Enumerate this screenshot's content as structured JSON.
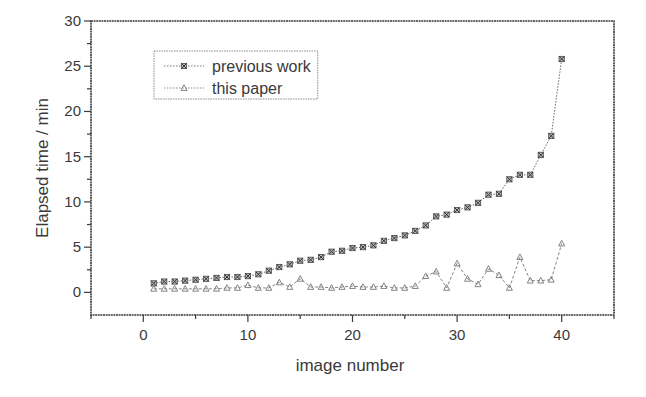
{
  "chart_data": {
    "type": "line",
    "title": "",
    "xlabel": "image number",
    "ylabel": "Elapsed time / min",
    "xlim": [
      -5,
      45
    ],
    "ylim": [
      -2.5,
      30
    ],
    "xticks": [
      0,
      10,
      20,
      30,
      40
    ],
    "yticks": [
      0,
      5,
      10,
      15,
      20,
      25,
      30
    ],
    "grid": false,
    "legend_position": "upper-left (inset box)",
    "x": [
      1,
      2,
      3,
      4,
      5,
      6,
      7,
      8,
      9,
      10,
      11,
      12,
      13,
      14,
      15,
      16,
      17,
      18,
      19,
      20,
      21,
      22,
      23,
      24,
      25,
      26,
      27,
      28,
      29,
      30,
      31,
      32,
      33,
      34,
      35,
      36,
      37,
      38,
      39,
      40
    ],
    "series": [
      {
        "name": "previous work",
        "marker": "x-square",
        "line": "dotted",
        "values": [
          1.0,
          1.2,
          1.2,
          1.3,
          1.4,
          1.5,
          1.6,
          1.7,
          1.7,
          1.8,
          2.0,
          2.4,
          2.8,
          3.1,
          3.5,
          3.6,
          3.9,
          4.5,
          4.6,
          4.9,
          5.0,
          5.2,
          5.7,
          6.0,
          6.3,
          6.8,
          7.4,
          8.4,
          8.6,
          9.1,
          9.4,
          9.9,
          10.8,
          10.9,
          12.5,
          13.0,
          13.0,
          15.2,
          17.3,
          25.8
        ]
      },
      {
        "name": "this paper",
        "marker": "triangle",
        "line": "dashed",
        "values": [
          0.4,
          0.4,
          0.4,
          0.4,
          0.4,
          0.4,
          0.4,
          0.5,
          0.5,
          0.8,
          0.5,
          0.5,
          1.1,
          0.6,
          1.5,
          0.6,
          0.6,
          0.5,
          0.6,
          0.7,
          0.6,
          0.6,
          0.7,
          0.5,
          0.5,
          0.7,
          1.8,
          2.3,
          0.5,
          3.2,
          1.5,
          0.9,
          2.6,
          1.9,
          0.5,
          3.9,
          1.3,
          1.3,
          1.4,
          5.4
        ]
      }
    ]
  },
  "legend": {
    "items": [
      {
        "label": "previous work"
      },
      {
        "label": "this paper"
      }
    ]
  },
  "colors": {
    "axis": "#3a3a3a",
    "series_previous_work": "#555555",
    "series_this_paper": "#777777"
  }
}
